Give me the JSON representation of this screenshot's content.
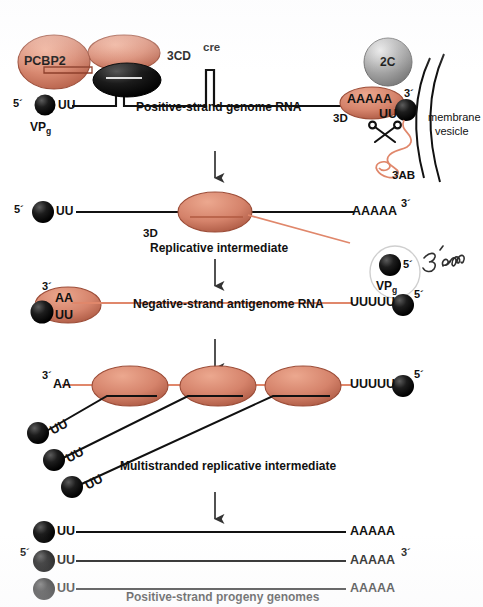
{
  "figure": {
    "colors": {
      "protein_salmon": "#d98a72",
      "protein_salmon_dark": "#b25c44",
      "protein_black": "#121212",
      "sphere_gray": "#a8a8a8",
      "rna_positive": "#111111",
      "rna_negative": "#e0876b",
      "membrane": "#111111",
      "annotation_ink": "#2a2a2a"
    }
  },
  "stage1": {
    "name": "Positive-strand genome RNA",
    "caption": "Positive-strand genome RNA",
    "pcbp2_label": "PCBP2",
    "cd_label": "3CD",
    "cre_label": "cre",
    "five_prime": "5´",
    "three_prime": "3´",
    "uu_left": "UU",
    "vpg_label_main": "VP",
    "vpg_label_sub": "g",
    "polyA": "AAAAA",
    "uu_right": "UU",
    "pol_label": "3D",
    "c2_label": "2C",
    "ab_label": "3AB",
    "membrane_line1": "membrane",
    "membrane_line2": "vesicle"
  },
  "stage2": {
    "caption": "Replicative intermediate",
    "five_prime": "5´",
    "three_prime": "3´",
    "uu_left": "UU",
    "polyA": "AAAAA",
    "pol_label": "3D",
    "vpg_label_main": "VP",
    "vpg_label_sub": "g",
    "vpg_five_prime": "5´",
    "handwriting": "3´ end"
  },
  "stage3": {
    "caption": "Negative-strand antigenome RNA",
    "three_prime": "3´",
    "five_prime": "5´",
    "aa": "AA",
    "uu": "UU",
    "polyU": "UUUUU"
  },
  "stage4": {
    "caption": "Multistranded replicative intermediate",
    "three_prime": "3´",
    "five_prime": "5´",
    "aa": "AA",
    "polyU": "UUUUU",
    "nascent_uu": [
      "UU",
      "UU",
      "UU"
    ]
  },
  "stage5": {
    "caption": "Positive-strand progeny genomes",
    "five_prime": "5´",
    "three_prime": "3´",
    "strands": [
      {
        "uu": "UU",
        "polyA": "AAAAA"
      },
      {
        "uu": "UU",
        "polyA": "AAAAA"
      },
      {
        "uu": "UU",
        "polyA": "AAAAA"
      }
    ]
  },
  "arrows": {
    "count": 4,
    "name": "downward-process-arrow"
  }
}
